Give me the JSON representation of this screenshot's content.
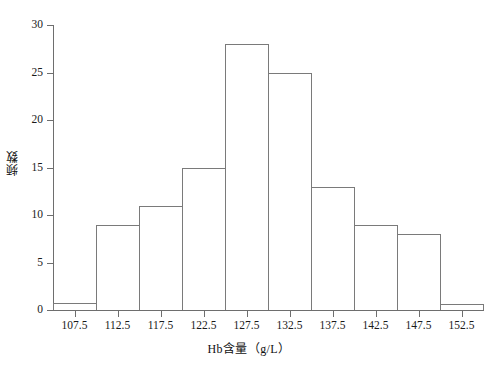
{
  "chart_data": {
    "type": "bar",
    "title": "",
    "xlabel": "Hb含量（g/L）",
    "ylabel": "频数",
    "categories": [
      "105-110",
      "110-115",
      "115-120",
      "120-125",
      "125-130",
      "130-135",
      "135-140",
      "140-145",
      "145-150",
      "150-155"
    ],
    "bin_edges": [
      105,
      110,
      115,
      120,
      125,
      130,
      135,
      140,
      145,
      150,
      155
    ],
    "values": [
      0.7,
      9,
      11,
      15,
      28,
      25,
      13,
      9,
      8,
      0.6
    ],
    "xtick_labels": [
      "107.5",
      "112.5",
      "117.5",
      "122.5",
      "127.5",
      "132.5",
      "137.5",
      "142.5",
      "147.5",
      "152.5"
    ],
    "xtick_values": [
      107.5,
      112.5,
      117.5,
      122.5,
      127.5,
      132.5,
      137.5,
      142.5,
      147.5,
      152.5
    ],
    "ytick_labels": [
      "0",
      "5",
      "10",
      "15",
      "20",
      "25",
      "30"
    ],
    "ytick_values": [
      0,
      5,
      10,
      15,
      20,
      25,
      30
    ],
    "ylim": [
      0,
      30
    ],
    "xlim": [
      105,
      155
    ],
    "grid": false,
    "legend": null,
    "bar_fill_color": "#ffffff",
    "bar_edge_color": "#7a7a7a",
    "axis_color": "#6e6e6e",
    "background_color": "#ffffff"
  }
}
